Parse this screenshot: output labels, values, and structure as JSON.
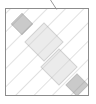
{
  "figure": {
    "title": "",
    "kind": "geometric-diagram",
    "canvas": {
      "width": 96,
      "height": 104,
      "background": "#ffffff"
    },
    "frame": {
      "name": "outer-square-frame",
      "x": 5.5,
      "y": 8.5,
      "width": 83,
      "height": 87,
      "stroke": "#8c8c8c",
      "stroke_width": 1,
      "fill": "#ffffff"
    },
    "hatch": {
      "name": "diagonal-hatch-pattern",
      "angle_deg": 45,
      "direction": "lower-left to upper-right",
      "spacing": 13,
      "stroke": "#c4c4c4",
      "stroke_width": 1
    },
    "colors": {
      "background": "#ffffff",
      "hatch_line": "#c4c4c4",
      "frame_stroke": "#8c8c8c",
      "light_square_fill": "#d2d2d2",
      "light_square_stroke": "#9a9a9a",
      "dark_square_fill": "#8a8a8a",
      "dark_square_stroke": "#6e6e6e",
      "tick_stroke": "#9a9a9a"
    },
    "shapes": [
      {
        "name": "dark-diamond-upper-left",
        "role": "small-rotated-square",
        "fill": "#8a8a8a",
        "stroke": "#6e6e6e",
        "center_x": 22,
        "center_y": 24,
        "half_diagonal": 10.5,
        "rotation_deg": 45
      },
      {
        "name": "light-diamond-center",
        "role": "large-rotated-square",
        "fill": "#d2d2d2",
        "stroke": "#9a9a9a",
        "center_x": 44,
        "center_y": 42,
        "half_diagonal": 19,
        "rotation_deg": 45
      },
      {
        "name": "light-diamond-lower-right",
        "role": "large-rotated-square",
        "fill": "#d2d2d2",
        "stroke": "#9a9a9a",
        "center_x": 59,
        "center_y": 67,
        "half_diagonal": 18,
        "rotation_deg": 45
      },
      {
        "name": "dark-diamond-lower-right",
        "role": "small-rotated-square",
        "fill": "#8a8a8a",
        "stroke": "#6e6e6e",
        "center_x": 77,
        "center_y": 85,
        "half_diagonal": 11,
        "rotation_deg": 45
      }
    ],
    "tick": {
      "name": "diagonal-tick-above-frame",
      "x1": 57,
      "y1": 10,
      "x2": 50.5,
      "y2": 0,
      "stroke": "#9a9a9a",
      "stroke_width": 1
    }
  }
}
